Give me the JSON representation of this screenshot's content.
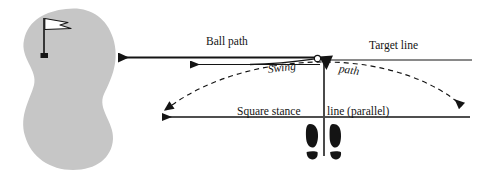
{
  "figure": {
    "type": "golf-setup-diagram",
    "background_color": "#ffffff",
    "ink_color": "#141414",
    "green_color": "#c6c6c6"
  },
  "labels": {
    "ball_path": "Ball path",
    "target_line": "Target line",
    "swing": "Swing",
    "path": "path",
    "stance_left": "Square stance",
    "stance_right": "line (parallel)"
  },
  "elements": {
    "green": "putting-green",
    "flag": "flagstick-with-pennant",
    "hole": "hole-marker",
    "ball": "golf-ball",
    "clubhead": "clubhead",
    "shaft": "club-shaft",
    "feet": "footprints-pair",
    "ball_path_arrow_upper": "ball-path-arrow-solid",
    "ball_path_arrow_lower": "ball-path-arrow-outline",
    "target_line": "target-line",
    "stance_line": "square-stance-line",
    "swing_arc": "swing-path-dashed-arc"
  },
  "geometry": {
    "ball_x": 324,
    "ball_y": 60,
    "target_line_y": 60,
    "stance_line_y": 117,
    "green_bounds": [
      22,
      8,
      115,
      170
    ]
  }
}
